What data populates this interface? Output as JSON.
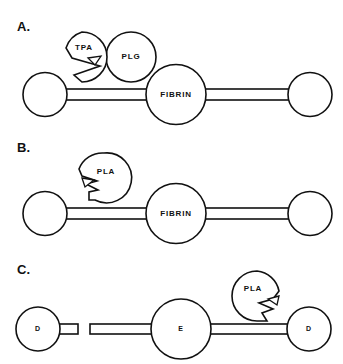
{
  "figure": {
    "background_color": "#ffffff",
    "line_color": "#111111",
    "width": 343,
    "height": 364
  },
  "panels": [
    {
      "id": "A",
      "label": "A.",
      "description": "TPA and plasminogen bound to fibrin strand",
      "substrate_label": "FIBRIN",
      "nodes": [
        {
          "name": "tpa",
          "label": "TPA",
          "shape": "notched-circle",
          "notch": "right-wedge"
        },
        {
          "name": "plg",
          "label": "PLG",
          "shape": "circle"
        },
        {
          "name": "fibrin-center",
          "label": "FIBRIN",
          "shape": "circle"
        },
        {
          "name": "fibrin-left-end",
          "label": "",
          "shape": "circle"
        },
        {
          "name": "fibrin-right-end",
          "label": "",
          "shape": "circle"
        }
      ]
    },
    {
      "id": "B",
      "label": "B.",
      "description": "Plasmin with zigzag cleavage site acting on intact fibrin strand",
      "substrate_label": "FIBRIN",
      "nodes": [
        {
          "name": "pla",
          "label": "PLA",
          "shape": "notched-circle",
          "notch": "zigzag-left"
        },
        {
          "name": "fibrin-center",
          "label": "FIBRIN",
          "shape": "circle"
        },
        {
          "name": "fibrin-left-end",
          "label": "",
          "shape": "circle"
        },
        {
          "name": "fibrin-right-end",
          "label": "",
          "shape": "circle"
        }
      ]
    },
    {
      "id": "C",
      "label": "C.",
      "description": "Cleaved fibrin degradation products showing D, E and D domains with plasmin",
      "substrate_label": "",
      "nodes": [
        {
          "name": "d-left",
          "label": "D",
          "shape": "circle"
        },
        {
          "name": "e-center",
          "label": "E",
          "shape": "circle"
        },
        {
          "name": "d-right",
          "label": "D",
          "shape": "circle"
        },
        {
          "name": "pla",
          "label": "PLA",
          "shape": "notched-circle",
          "notch": "zigzag-right"
        }
      ]
    }
  ]
}
